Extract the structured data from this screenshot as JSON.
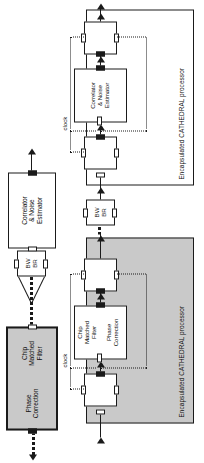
{
  "figure": {
    "type": "block-diagram",
    "orientation": "rotated-90-ccw",
    "colors": {
      "shaded_fill": "#c9c9c9",
      "plain_fill": "#ffffff",
      "stroke": "#1a1a1a"
    }
  },
  "reference_chain": {
    "blocks": [
      {
        "id": "chip-matched-filter-phase-correction",
        "fill": "shaded",
        "sections": [
          {
            "id": "chip-matched-filter",
            "label": "Chip\nMatched\nFilter"
          },
          {
            "id": "phase-correction",
            "label": "Phase\nCorrection"
          }
        ]
      },
      {
        "id": "bw-br",
        "fill": "plain",
        "label": "BW\nBR"
      },
      {
        "id": "correlator-noise-estimator",
        "fill": "plain",
        "label": "Correlator\n& Noise\nEstimator"
      }
    ]
  },
  "encapsulated_upper": {
    "title": "Encapsulated CATHEDRAL processor",
    "fill": "shaded",
    "clock_label": "clock",
    "inner_block": {
      "id": "chip-matched-filter-phase-correction",
      "fill": "plain",
      "sections": [
        {
          "id": "chip-matched-filter",
          "label": "Chip\nMatched\nFilter"
        },
        {
          "id": "phase-correction",
          "label": "Phase\nCorrection"
        }
      ]
    }
  },
  "encapsulated_lower": {
    "title": "Encapsulated CATHEDRAL processor",
    "fill": "plain",
    "clock_label": "clock",
    "inner_block": {
      "id": "correlator-noise-estimator",
      "fill": "plain",
      "label": "Correlator\n& Noise\nEstimator"
    },
    "io_block": {
      "id": "bw-br",
      "fill": "plain",
      "label": "BW\nBR"
    }
  }
}
